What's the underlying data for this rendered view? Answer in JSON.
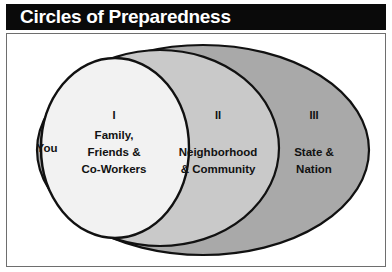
{
  "title": {
    "text": "Circles of Preparedness",
    "bar_color": "#0a0a0a",
    "text_color": "#ffffff"
  },
  "diagram": {
    "type": "nested-ellipse-venn",
    "frame_border_color": "#6e6e6e",
    "background": "#ffffff",
    "outline_color": "#111111",
    "rings": [
      {
        "id": "core",
        "roman": "",
        "label": "You",
        "fill": "#f2f2f2",
        "description": "innermost region of the inner ellipse"
      },
      {
        "id": "ring-1",
        "roman": "I",
        "label_lines": [
          "Family,",
          "Friends &",
          "Co-Workers"
        ],
        "fill": "#f2f2f2"
      },
      {
        "id": "ring-2",
        "roman": "II",
        "label_lines": [
          "Neighborhood",
          "& Community"
        ],
        "fill": "#c9c9c9"
      },
      {
        "id": "ring-3",
        "roman": "III",
        "label_lines": [
          "State &",
          "Nation"
        ],
        "fill": "#a9a9a9"
      }
    ]
  }
}
